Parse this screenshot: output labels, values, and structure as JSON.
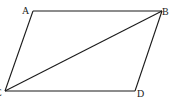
{
  "diagram": {
    "type": "parallelogram-with-diagonal",
    "vertices": {
      "A": {
        "label": "A",
        "x": 33,
        "y": 11
      },
      "B": {
        "label": "B",
        "x": 162,
        "y": 11
      },
      "C": {
        "label": "C",
        "x": 5,
        "y": 91
      },
      "D": {
        "label": "D",
        "x": 135,
        "y": 91
      }
    },
    "segments": [
      "AB",
      "BD",
      "DC",
      "CA",
      "CB"
    ],
    "colors": {
      "stroke": "#1a1a1a",
      "background": "#ffffff"
    }
  }
}
